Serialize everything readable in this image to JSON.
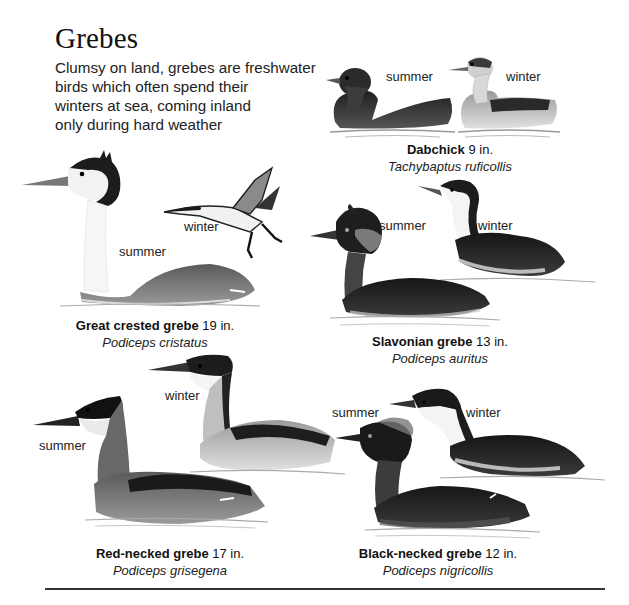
{
  "page": {
    "title": "Grebes",
    "intro_lines": [
      "Clumsy on land, grebes are freshwater",
      "birds which often spend their",
      "winters at sea, coming inland",
      "only during hard weather"
    ]
  },
  "species": [
    {
      "id": "dabchick",
      "common_name": "Dabchick",
      "size": "9 in.",
      "scientific_name": "Tachybaptus ruficollis",
      "labels": {
        "summer": "summer",
        "winter": "winter"
      }
    },
    {
      "id": "great-crested-grebe",
      "common_name": "Great crested grebe",
      "size": "19 in.",
      "scientific_name": "Podiceps cristatus",
      "labels": {
        "summer": "summer",
        "winter": "winter"
      }
    },
    {
      "id": "slavonian-grebe",
      "common_name": "Slavonian grebe",
      "size": "13 in.",
      "scientific_name": "Podiceps auritus",
      "labels": {
        "summer": "summer",
        "winter": "winter"
      }
    },
    {
      "id": "red-necked-grebe",
      "common_name": "Red-necked grebe",
      "size": "17 in.",
      "scientific_name": "Podiceps grisegena",
      "labels": {
        "summer": "summer",
        "winter": "winter"
      }
    },
    {
      "id": "black-necked-grebe",
      "common_name": "Black-necked grebe",
      "size": "12 in.",
      "scientific_name": "Podiceps nigricollis",
      "labels": {
        "summer": "summer",
        "winter": "winter"
      }
    }
  ],
  "colors": {
    "ink": "#111111",
    "dark_plumage": "#2a2a2a",
    "mid_plumage": "#6e6e6e",
    "light_plumage": "#c8c8c8",
    "water": "#bdbdbd"
  }
}
